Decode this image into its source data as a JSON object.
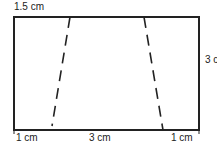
{
  "diagram": {
    "labels": {
      "top_left": "1.5 cm",
      "right_height": "3 cm",
      "bottom_left": "1 cm",
      "bottom_middle": "3 cm",
      "bottom_right": "1 cm"
    },
    "colors": {
      "stroke": "#222222",
      "background": "#ffffff"
    }
  }
}
